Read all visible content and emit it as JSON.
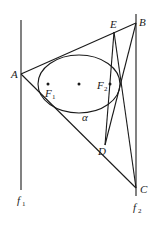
{
  "diagram": {
    "type": "geometry",
    "colors": {
      "stroke": "#1a1a1a",
      "background": "#ffffff"
    },
    "points": {
      "A": {
        "label": "A",
        "x": 21,
        "y": 74
      },
      "B": {
        "label": "B",
        "x": 136,
        "y": 23
      },
      "C": {
        "label": "C",
        "x": 136,
        "y": 188
      },
      "D": {
        "label": "D",
        "x": 105,
        "y": 145
      },
      "E": {
        "label": "E",
        "x": 114,
        "y": 32
      },
      "F1": {
        "label": "F",
        "sub": "1",
        "x": 48,
        "y": 84
      },
      "F2": {
        "label": "F",
        "sub": "2",
        "x": 110,
        "y": 84
      },
      "O": {
        "x": 79,
        "y": 84
      }
    },
    "ellipse": {
      "cx": 79,
      "cy": 84,
      "rx": 41,
      "ry": 29
    },
    "lines": {
      "f1": {
        "label": "f",
        "sub": "1"
      },
      "f2": {
        "label": "f",
        "sub": "2"
      }
    },
    "annotation": {
      "alpha": "α"
    }
  }
}
